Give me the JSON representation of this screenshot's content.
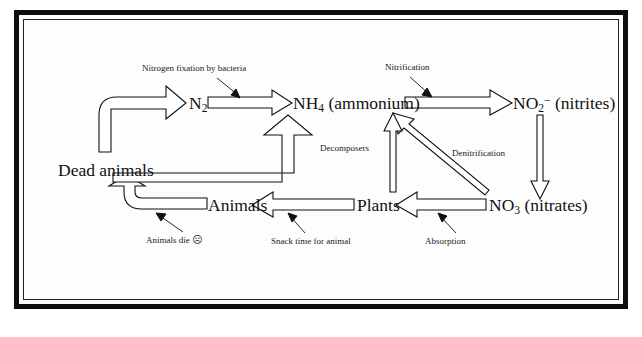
{
  "diagram": {
    "type": "cycle-flow-diagram",
    "colors": {
      "frame": "#0d0d0d",
      "arrow_stroke": "#111111",
      "arrow_fill": "#ffffff",
      "background": "#fdfdfd",
      "text": "#111111"
    },
    "nodes": [
      {
        "id": "n2",
        "label_html": "N<sub>2</sub>",
        "label_text": "N2",
        "x": 189,
        "y": 102
      },
      {
        "id": "nh4",
        "label_html": "NH<sub>4</sub> (ammonium)",
        "label_text": "NH4 (ammonium)",
        "x": 297,
        "y": 102
      },
      {
        "id": "no2",
        "label_html": "NO<sub>2</sub><sup>−</sup> (nitrites)",
        "label_text": "NO2- (nitrites)",
        "x": 524,
        "y": 102
      },
      {
        "id": "no3",
        "label_html": "NO<sub>3</sub> (nitrates)",
        "label_text": "NO3 (nitrates)",
        "x": 496,
        "y": 205
      },
      {
        "id": "plants",
        "label_html": "Plants",
        "label_text": "Plants",
        "x": 365,
        "y": 205
      },
      {
        "id": "animals",
        "label_html": "Animals",
        "label_text": "Animals",
        "x": 215,
        "y": 205
      },
      {
        "id": "dead_animals",
        "label_html": "Dead animals",
        "label_text": "Dead animals",
        "x": 63,
        "y": 170
      }
    ],
    "annotations": [
      {
        "id": "nitrogen_fixation",
        "label": "Nitrogen fixation by bacteria",
        "x": 142,
        "y": 68
      },
      {
        "id": "nitrification",
        "label": "Nitrification",
        "x": 385,
        "y": 67
      },
      {
        "id": "decomposers",
        "label": "Decomposers",
        "x": 320,
        "y": 148
      },
      {
        "id": "denitrification",
        "label": "Denitrification",
        "x": 452,
        "y": 153
      },
      {
        "id": "animals_die",
        "label": "Animals die",
        "emoticon": "☹",
        "x": 146,
        "y": 238
      },
      {
        "id": "snack_time",
        "label": "Snack time for animal",
        "x": 271,
        "y": 240
      },
      {
        "id": "absorption",
        "label": "Absorption",
        "x": 425,
        "y": 240
      }
    ],
    "flows": [
      {
        "id": "flow-deadanimals-to-n2",
        "from": "dead_animals",
        "to": "n2",
        "style": "block-curve",
        "label": "Nitrogen fixation by bacteria"
      },
      {
        "id": "flow-n2-to-nh4",
        "from": "n2",
        "to": "nh4",
        "style": "block-horizontal",
        "label": ""
      },
      {
        "id": "flow-nh4-to-no2",
        "from": "nh4",
        "to": "no2",
        "style": "block-horizontal",
        "label": "Nitrification"
      },
      {
        "id": "flow-no2-to-no3",
        "from": "no2",
        "to": "no3",
        "style": "thin-vertical-down",
        "label": ""
      },
      {
        "id": "flow-no3-to-plants",
        "from": "no3",
        "to": "plants",
        "style": "block-horizontal-left",
        "label": "Absorption"
      },
      {
        "id": "flow-no3-to-nh4",
        "from": "no3",
        "to": "nh4",
        "style": "thin-diagonal",
        "label": "Denitrification"
      },
      {
        "id": "flow-plants-to-nh4",
        "from": "plants",
        "to": "nh4",
        "style": "thin-vertical-up",
        "label": ""
      },
      {
        "id": "flow-plants-to-animals",
        "from": "plants",
        "to": "animals",
        "style": "block-horizontal-left",
        "label": "Snack time for animal"
      },
      {
        "id": "flow-animals-to-dead",
        "from": "animals",
        "to": "dead_animals",
        "style": "block-curve-left",
        "label": "Animals die"
      },
      {
        "id": "flow-dead-to-nh4",
        "from": "dead_animals",
        "to": "nh4",
        "style": "block-elbow-up",
        "label": "Decomposers"
      }
    ]
  }
}
